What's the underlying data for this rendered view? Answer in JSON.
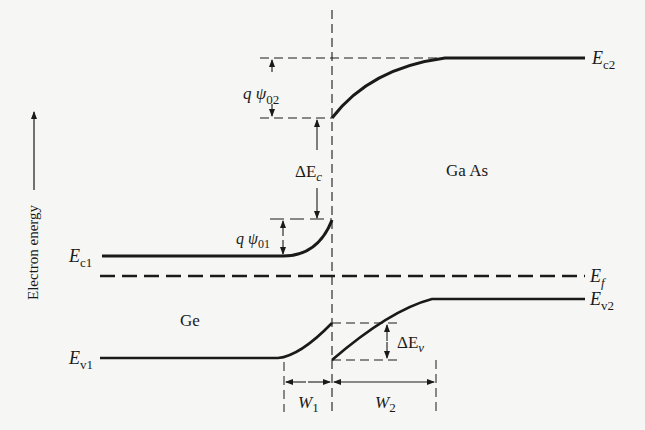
{
  "diagram": {
    "y_axis_label": "Electron energy",
    "materials": {
      "left": "Ge",
      "right": "Ga As"
    },
    "levels": {
      "Ec1": {
        "main": "E",
        "sub": "c1"
      },
      "Ev1": {
        "main": "E",
        "sub": "v1"
      },
      "Ec2": {
        "main": "E",
        "sub": "c2"
      },
      "Ev2": {
        "main": "E",
        "sub": "v2"
      },
      "Ef": {
        "main": "E",
        "sub": "f"
      }
    },
    "annotations": {
      "q_psi_02": {
        "main": "q ψ",
        "sub": "02"
      },
      "q_psi_01": {
        "main": "q ψ",
        "sub": "01"
      },
      "delta_Ec": {
        "main": "ΔE",
        "sub": "c"
      },
      "delta_Ev": {
        "main": "ΔE",
        "sub": "v"
      },
      "W1": {
        "main": "W",
        "sub": "1"
      },
      "W2": {
        "main": "W",
        "sub": "2"
      }
    },
    "colors": {
      "ink": "#1a1a1a",
      "background": "#f6f6f4"
    }
  }
}
